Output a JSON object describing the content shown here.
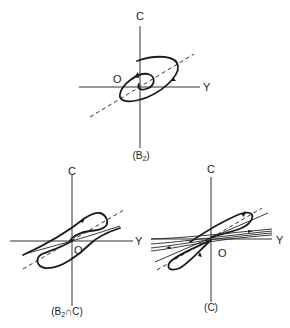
{
  "figures": [
    {
      "id": "B2",
      "caption_main": "(B",
      "caption_sub": "2",
      "caption_end": ")",
      "axis_vertical": "C",
      "axis_horizontal": "Y",
      "origin": "O"
    },
    {
      "id": "B2-intersect-C",
      "caption_main": "(B",
      "caption_sub": "2",
      "caption_end": "∩C)",
      "axis_vertical": "C",
      "axis_horizontal": "Y",
      "origin": "O"
    },
    {
      "id": "C",
      "caption_main": "(C)",
      "caption_sub": "",
      "caption_end": "",
      "axis_vertical": "C",
      "axis_horizontal": "Y",
      "origin": "O"
    }
  ]
}
